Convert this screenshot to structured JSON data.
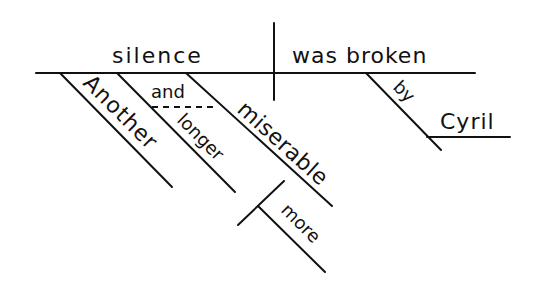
{
  "diagram": {
    "type": "sentence-diagram",
    "sentence_parts": {
      "subject": "silence",
      "verb": "was broken",
      "modifiers_of_subject": [
        "Another",
        "and",
        "longer",
        "miserable"
      ],
      "modifier_of_miserable": "more",
      "prepositional_phrase": {
        "preposition": "by",
        "object": "Cyril"
      }
    },
    "words": {
      "subject": "silence",
      "verb": "was broken",
      "another": "Another",
      "conjunction": "and",
      "longer": "longer",
      "miserable": "miserable",
      "more": "more",
      "preposition": "by",
      "object": "Cyril"
    },
    "colors": {
      "ink": "#111111",
      "background": "#ffffff"
    }
  }
}
